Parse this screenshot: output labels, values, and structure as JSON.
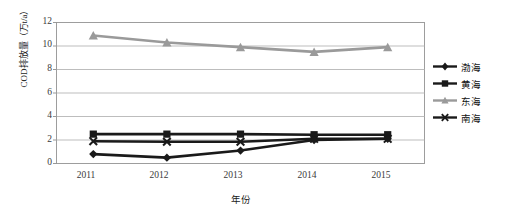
{
  "chart_data": {
    "type": "line",
    "title": "",
    "xlabel": "年份",
    "ylabel": "COD排放量（万t/a）",
    "categories": [
      "2011",
      "2012",
      "2013",
      "2014",
      "2015"
    ],
    "x": [
      2011,
      2012,
      2013,
      2014,
      2015
    ],
    "ylim": [
      0,
      12
    ],
    "yticks": [
      "0",
      "2",
      "4",
      "6",
      "8",
      "10",
      "12"
    ],
    "ytick_values": [
      0,
      2,
      4,
      6,
      8,
      10,
      12
    ],
    "grid": true,
    "grid_axis": "y",
    "legend_position": "right",
    "series": [
      {
        "name": "渤海",
        "marker": "diamond",
        "color": "#1a1a1a",
        "values": [
          0.8,
          0.5,
          1.1,
          2.0,
          2.1
        ]
      },
      {
        "name": "黄海",
        "marker": "square",
        "color": "#1a1a1a",
        "values": [
          2.5,
          2.5,
          2.5,
          2.45,
          2.45
        ]
      },
      {
        "name": "东海",
        "marker": "triangle",
        "color": "#9a9a9a",
        "values": [
          10.9,
          10.3,
          9.9,
          9.5,
          9.9
        ]
      },
      {
        "name": "南海",
        "marker": "cross",
        "color": "#1a1a1a",
        "values": [
          1.9,
          1.85,
          1.85,
          2.1,
          2.1
        ]
      }
    ]
  },
  "colors": {
    "plot_border": "#9d9d9d",
    "gridline": "#b5b5b5",
    "background": "#ffffff",
    "text": "#1a1a1a",
    "series_dark": "#1a1a1a",
    "series_gray": "#9a9a9a"
  }
}
